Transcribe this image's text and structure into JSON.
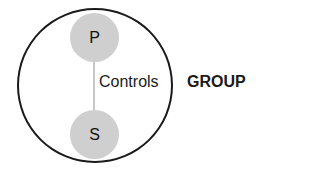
{
  "diagram": {
    "group": {
      "label": "GROUP"
    },
    "nodes": [
      {
        "id": "P",
        "label": "P"
      },
      {
        "id": "S",
        "label": "S"
      }
    ],
    "edge": {
      "from": "P",
      "to": "S",
      "label": "Controls"
    },
    "colors": {
      "node_fill": "#cfcfcf",
      "edge": "#c8c8c8",
      "outline": "#1a1a1a"
    }
  }
}
